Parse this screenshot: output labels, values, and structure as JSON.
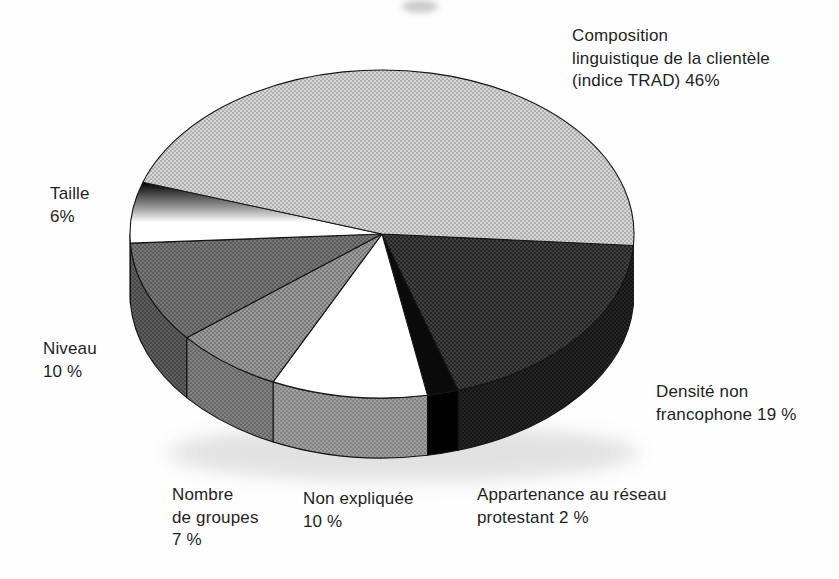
{
  "chart_data": {
    "type": "pie",
    "style": "3d",
    "title": "",
    "values_unit": "%",
    "outline_color": "#151515",
    "text_color": "#1f1f1f",
    "background_color": "#fefefe",
    "geometry": {
      "cx": 382,
      "cy": 234,
      "rx": 252,
      "ry": 164,
      "depth": 60,
      "start_deg": 4,
      "clockwise": true
    },
    "slices": [
      {
        "key": "densite",
        "label_text": "Densité non francophone 19 %",
        "value": 19,
        "top_fill": {
          "type": "dots",
          "bg": "#242424",
          "dot": "#454545"
        },
        "rim_fill": {
          "type": "dots",
          "bg": "#151515",
          "dot": "#262626"
        },
        "label": {
          "x": 656,
          "y": 381,
          "lines": [
            "Densité non",
            "francophone 19 %"
          ]
        }
      },
      {
        "key": "appartenance",
        "label_text": "Appartenance au réseau protestant 2 %",
        "value": 2,
        "top_fill": {
          "type": "solid",
          "color": "#0a0a0a"
        },
        "rim_fill": {
          "type": "solid",
          "color": "#000000"
        },
        "label": {
          "x": 477,
          "y": 484,
          "lines": [
            "Appartenance au réseau",
            "protestant 2 %"
          ]
        }
      },
      {
        "key": "non-expliquee",
        "label_text": "Non expliquée 10 %",
        "value": 10,
        "top_fill": {
          "type": "solid",
          "color": "#ffffff"
        },
        "rim_fill": {
          "type": "dots",
          "bg": "#a0a0a0",
          "dot": "#7e7e7e"
        },
        "label": {
          "x": 303,
          "y": 488,
          "lines": [
            "Non expliquée",
            "10 %"
          ]
        }
      },
      {
        "key": "nombre-de-groupes",
        "label_text": "Nombre de groupes 7 %",
        "value": 7,
        "top_fill": {
          "type": "dots",
          "bg": "#9b9b9b",
          "dot": "#757575"
        },
        "rim_fill": {
          "type": "dots",
          "bg": "#828282",
          "dot": "#626262"
        },
        "label": {
          "x": 172,
          "y": 484,
          "lines": [
            "Nombre",
            "de groupes",
            "7 %"
          ]
        }
      },
      {
        "key": "niveau",
        "label_text": "Niveau 10 %",
        "value": 10,
        "top_fill": {
          "type": "dots",
          "bg": "#787878",
          "dot": "#565656"
        },
        "rim_fill": {
          "type": "dots",
          "bg": "#5e5e5e",
          "dot": "#434343"
        },
        "label": {
          "x": 43,
          "y": 338,
          "lines": [
            "Niveau",
            "10 %"
          ]
        }
      },
      {
        "key": "taille",
        "label_text": "Taille 6%",
        "value": 6,
        "top_fill": {
          "type": "gradient",
          "stops": [
            [
              0,
              "#000000"
            ],
            [
              0.42,
              "#9b9b9b"
            ],
            [
              0.66,
              "#ffffff"
            ],
            [
              1,
              "#ffffff"
            ]
          ]
        },
        "rim_fill": {
          "type": "solid",
          "color": "#e3e3e3"
        },
        "label": {
          "x": 50,
          "y": 183,
          "lines": [
            "Taille",
            "6%"
          ]
        }
      },
      {
        "key": "composition",
        "label_text": "Composition linguistique de la clientèle (indice TRAD) 46%",
        "value": 46,
        "top_fill": {
          "type": "dots",
          "bg": "#d6d6d6",
          "dot": "#ababab"
        },
        "rim_fill": {
          "type": "dots",
          "bg": "#b5b5b5",
          "dot": "#949494"
        },
        "label": {
          "x": 572,
          "y": 25,
          "lines": [
            "Composition",
            "linguistique de la clientèle",
            "(indice TRAD) 46%"
          ]
        }
      }
    ]
  }
}
